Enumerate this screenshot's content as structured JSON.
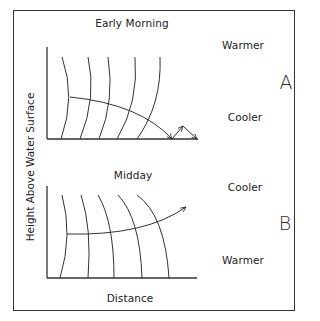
{
  "figure": {
    "y_axis_label": "Height Above Water Surface",
    "x_axis_label": "Distance",
    "stroke_color": "#333333"
  },
  "panels": [
    {
      "id": "A",
      "letter": "A",
      "title": "Early Morning",
      "top_label": "Warmer",
      "bottom_label": "Cooler",
      "description": "Sound ray refracts downward toward the surface and reflects, due to cooler air near the surface"
    },
    {
      "id": "B",
      "letter": "B",
      "title": "Midday",
      "top_label": "Cooler",
      "bottom_label": "Warmer",
      "description": "Sound ray refracts upward away from the surface, due to warmer air near the surface"
    }
  ]
}
